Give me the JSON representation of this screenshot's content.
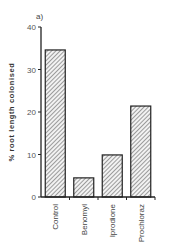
{
  "chart_data": {
    "type": "bar",
    "panel_label": "a)",
    "title": "",
    "xlabel": "",
    "ylabel": "% root length colonised",
    "categories": [
      "Control",
      "Benomyl",
      "Iprodione",
      "Prochloraz"
    ],
    "values": [
      34.6,
      4.5,
      9.9,
      21.4
    ],
    "ylim": [
      0,
      40
    ],
    "yticks": [
      0,
      10,
      20,
      30,
      40
    ],
    "grid": false,
    "legend": null,
    "bar_fill": "diagonal-hatch"
  },
  "colors": {
    "axis": "#222222",
    "bar_edge": "#222222",
    "hatch": "#777777"
  }
}
